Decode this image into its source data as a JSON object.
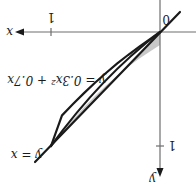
{
  "figure": {
    "orientation": "rotated-180",
    "origin_label": "0",
    "x_axis": {
      "label": "x",
      "tick_label": "1"
    },
    "y_axis": {
      "label": "y",
      "tick_label": "1"
    },
    "curves": [
      {
        "id": "line",
        "label": "y = x"
      },
      {
        "id": "parabola",
        "label": "y = 0.3x² + 0.7x"
      }
    ],
    "shaded_region": "area between y = x and y = 0.3x² + 0.7x on [0, 1]",
    "colors": {
      "curve": "#1a1a1a",
      "axis": "#6e6e6e",
      "region": "#c8c8c8"
    }
  }
}
